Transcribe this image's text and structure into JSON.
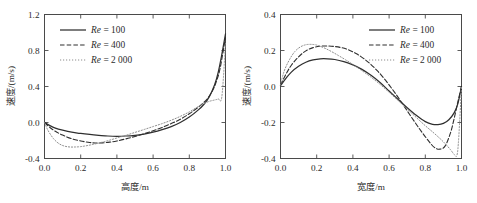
{
  "figure": {
    "panels": [
      "left",
      "right"
    ]
  },
  "chart_data": [
    {
      "id": "left",
      "type": "line",
      "title": "",
      "xlabel": "高度/m",
      "ylabel": "速度/(m/s)",
      "xlim": [
        0.0,
        1.0
      ],
      "ylim": [
        -0.4,
        1.2
      ],
      "xticks": [
        0.0,
        0.2,
        0.4,
        0.6,
        0.8,
        1.0
      ],
      "xticklabels": [
        "0.0",
        "0.2",
        "0.4",
        "0.6",
        "0.8",
        "1.0"
      ],
      "yticks": [
        -0.4,
        0.0,
        0.4,
        0.8,
        1.2
      ],
      "yticklabels": [
        "-0.4",
        "0.0",
        "0.4",
        "0.8",
        "1.2"
      ],
      "grid": false,
      "legend_position": "upper-left",
      "series": [
        {
          "name": "Re = 100",
          "name_prefix": "Re",
          "name_value": "= 100",
          "style": "solid",
          "x": [
            0.0,
            0.03,
            0.06,
            0.1,
            0.15,
            0.2,
            0.25,
            0.3,
            0.35,
            0.4,
            0.45,
            0.5,
            0.55,
            0.6,
            0.65,
            0.7,
            0.75,
            0.8,
            0.85,
            0.88,
            0.91,
            0.94,
            0.96,
            0.98,
            1.0
          ],
          "y": [
            0.0,
            -0.035,
            -0.062,
            -0.085,
            -0.108,
            -0.122,
            -0.133,
            -0.142,
            -0.15,
            -0.153,
            -0.15,
            -0.142,
            -0.128,
            -0.108,
            -0.08,
            -0.045,
            0.0,
            0.06,
            0.14,
            0.2,
            0.285,
            0.42,
            0.56,
            0.76,
            0.985
          ]
        },
        {
          "name": "Re = 400",
          "name_prefix": "Re",
          "name_value": "= 400",
          "style": "dashed",
          "x": [
            0.0,
            0.03,
            0.06,
            0.1,
            0.15,
            0.2,
            0.25,
            0.28,
            0.32,
            0.36,
            0.4,
            0.45,
            0.5,
            0.55,
            0.6,
            0.65,
            0.7,
            0.75,
            0.8,
            0.84,
            0.87,
            0.9,
            0.93,
            0.95,
            0.97,
            1.0
          ],
          "y": [
            0.0,
            -0.055,
            -0.098,
            -0.14,
            -0.18,
            -0.205,
            -0.222,
            -0.228,
            -0.226,
            -0.218,
            -0.205,
            -0.182,
            -0.155,
            -0.125,
            -0.092,
            -0.055,
            -0.012,
            0.035,
            0.098,
            0.155,
            0.205,
            0.265,
            0.36,
            0.46,
            0.6,
            0.945
          ]
        },
        {
          "name": "Re = 2 000",
          "name_prefix": "Re",
          "name_value": "= 2 000",
          "style": "dotted",
          "x": [
            0.0,
            0.02,
            0.05,
            0.08,
            0.11,
            0.14,
            0.17,
            0.2,
            0.24,
            0.28,
            0.32,
            0.36,
            0.4,
            0.45,
            0.5,
            0.55,
            0.6,
            0.65,
            0.7,
            0.75,
            0.8,
            0.85,
            0.88,
            0.91,
            0.94,
            0.96,
            0.98,
            1.0
          ],
          "y": [
            0.0,
            -0.09,
            -0.18,
            -0.235,
            -0.262,
            -0.272,
            -0.272,
            -0.268,
            -0.255,
            -0.238,
            -0.218,
            -0.196,
            -0.172,
            -0.142,
            -0.11,
            -0.078,
            -0.045,
            -0.012,
            0.025,
            0.068,
            0.118,
            0.178,
            0.21,
            0.235,
            0.25,
            0.262,
            0.29,
            0.88
          ]
        }
      ]
    },
    {
      "id": "right",
      "type": "line",
      "title": "",
      "xlabel": "宽度/m",
      "ylabel": "速度/(m/s)",
      "xlim": [
        0.0,
        1.0
      ],
      "ylim": [
        -0.4,
        0.4
      ],
      "xticks": [
        0.0,
        0.2,
        0.4,
        0.6,
        0.8,
        1.0
      ],
      "xticklabels": [
        "0.0",
        "0.2",
        "0.4",
        "0.6",
        "0.8",
        "1.0"
      ],
      "yticks": [
        -0.4,
        -0.2,
        0.0,
        0.2,
        0.4
      ],
      "yticklabels": [
        "-0.4",
        "-0.2",
        "0.0",
        "0.2",
        "0.4"
      ],
      "grid": false,
      "legend_position": "upper-right",
      "series": [
        {
          "name": "Re = 100",
          "name_prefix": "Re",
          "name_value": "= 100",
          "style": "solid",
          "x": [
            0.0,
            0.03,
            0.06,
            0.1,
            0.14,
            0.18,
            0.22,
            0.26,
            0.3,
            0.35,
            0.4,
            0.45,
            0.5,
            0.55,
            0.6,
            0.65,
            0.7,
            0.75,
            0.8,
            0.84,
            0.87,
            0.9,
            0.93,
            0.96,
            0.98,
            1.0
          ],
          "y": [
            0.005,
            0.045,
            0.08,
            0.112,
            0.135,
            0.148,
            0.154,
            0.154,
            0.15,
            0.138,
            0.12,
            0.095,
            0.062,
            0.022,
            -0.025,
            -0.072,
            -0.118,
            -0.16,
            -0.195,
            -0.21,
            -0.212,
            -0.205,
            -0.185,
            -0.145,
            -0.095,
            0.0
          ]
        },
        {
          "name": "Re = 400",
          "name_prefix": "Re",
          "name_value": "= 400",
          "style": "dashed",
          "x": [
            0.0,
            0.03,
            0.06,
            0.1,
            0.14,
            0.18,
            0.22,
            0.26,
            0.3,
            0.34,
            0.38,
            0.42,
            0.46,
            0.5,
            0.54,
            0.58,
            0.62,
            0.66,
            0.7,
            0.74,
            0.78,
            0.82,
            0.85,
            0.88,
            0.91,
            0.94,
            0.96,
            0.98,
            1.0
          ],
          "y": [
            0.008,
            0.068,
            0.118,
            0.165,
            0.198,
            0.216,
            0.224,
            0.225,
            0.222,
            0.215,
            0.202,
            0.182,
            0.155,
            0.122,
            0.082,
            0.035,
            -0.018,
            -0.075,
            -0.135,
            -0.195,
            -0.252,
            -0.305,
            -0.338,
            -0.348,
            -0.33,
            -0.255,
            -0.175,
            -0.085,
            0.0
          ]
        },
        {
          "name": "Re = 2 000",
          "name_prefix": "Re",
          "name_value": "= 2 000",
          "style": "dotted",
          "x": [
            0.0,
            0.02,
            0.05,
            0.08,
            0.11,
            0.14,
            0.17,
            0.2,
            0.24,
            0.28,
            0.32,
            0.36,
            0.4,
            0.45,
            0.5,
            0.55,
            0.6,
            0.65,
            0.7,
            0.75,
            0.8,
            0.84,
            0.88,
            0.91,
            0.94,
            0.96,
            0.975,
            0.985,
            1.0
          ],
          "y": [
            0.008,
            0.085,
            0.15,
            0.195,
            0.22,
            0.232,
            0.234,
            0.23,
            0.215,
            0.195,
            0.172,
            0.148,
            0.122,
            0.088,
            0.052,
            0.012,
            -0.032,
            -0.078,
            -0.125,
            -0.172,
            -0.218,
            -0.252,
            -0.288,
            -0.318,
            -0.352,
            -0.378,
            -0.382,
            -0.28,
            0.0
          ]
        }
      ]
    }
  ]
}
